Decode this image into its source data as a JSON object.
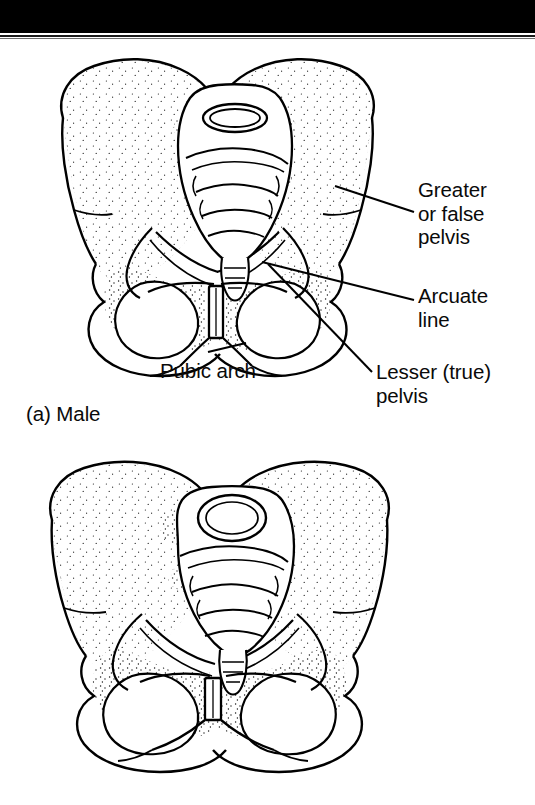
{
  "figure": {
    "background_color": "#ffffff",
    "ink_color": "#000000",
    "scan_band_color": "#000000"
  },
  "labels": {
    "greater_false_pelvis": "Greater\nor false\npelvis",
    "arcuate_line": "Arcuate\nline",
    "lesser_true_pelvis": "Lesser (true)\npelvis",
    "pubic_arch": "Pubic arch"
  },
  "captions": {
    "male": "(a) Male"
  },
  "panels": [
    {
      "id": "male-pelvis",
      "caption": "(a) Male",
      "description": "Anterior view line drawing of a male bony pelvis with stipple shading, narrow heart-shaped pelvic inlet and narrow pubic arch",
      "labels": [
        "Greater or false pelvis",
        "Arcuate line",
        "Lesser (true) pelvis",
        "Pubic arch"
      ]
    },
    {
      "id": "female-pelvis",
      "caption": "",
      "description": "Anterior view line drawing of a female bony pelvis with stipple shading, wide oval pelvic inlet and broad pubic arch",
      "labels": []
    }
  ],
  "leader_lines": [
    {
      "name": "greater-false-pelvis-leader",
      "from": [
        335,
        186
      ],
      "to": [
        414,
        212
      ]
    },
    {
      "name": "arcuate-line-leader",
      "from": [
        262,
        262
      ],
      "to": [
        414,
        300
      ]
    },
    {
      "name": "lesser-true-pelvis-leader",
      "from": [
        268,
        264
      ],
      "to": [
        372,
        372
      ]
    },
    {
      "name": "pubic-arch-leader",
      "from": [
        245,
        345
      ],
      "to": [
        207,
        352
      ]
    }
  ]
}
